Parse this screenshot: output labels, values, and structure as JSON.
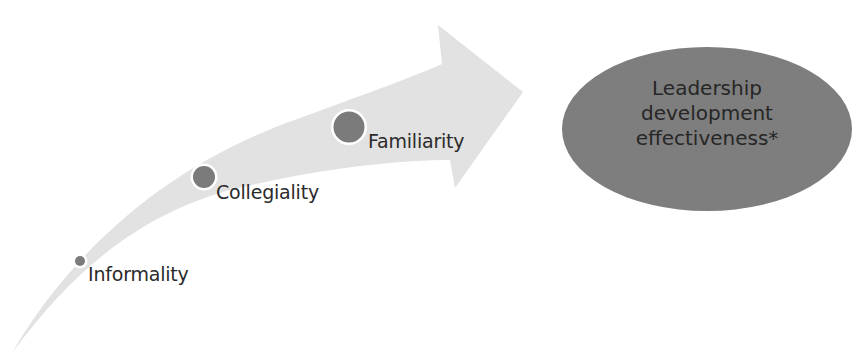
{
  "diagram": {
    "stages": [
      {
        "label": "Informality",
        "icon": "circle-marker",
        "marker_size": "small"
      },
      {
        "label": "Collegiality",
        "icon": "circle-marker",
        "marker_size": "medium"
      },
      {
        "label": "Familiarity",
        "icon": "circle-marker",
        "marker_size": "large"
      }
    ],
    "outcome": {
      "lines": [
        "Leadership",
        "development",
        "effectiveness*"
      ]
    },
    "colors": {
      "arrow_fill": "#e3e3e3",
      "marker_fill": "#7b7b7b",
      "marker_ring": "#ffffff",
      "outcome_fill": "#7a7a7a",
      "text": "#2b2b2b"
    }
  }
}
